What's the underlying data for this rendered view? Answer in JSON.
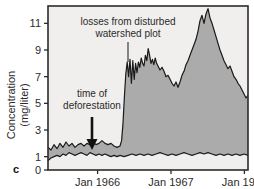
{
  "figure": {
    "panel_label": "c",
    "background": "#ffffff",
    "plot_background": "#f0efed",
    "fill_color": "#ababab",
    "line_color": "#1a1a1a",
    "axis_color": "#2b2b2b"
  },
  "axes": {
    "ylabel_line1": "Concentration",
    "ylabel_line2": "(mg/liter)",
    "yticks": [
      0,
      1,
      3,
      5,
      7,
      9,
      11
    ],
    "ytick_labels": [
      "0",
      "1",
      "3",
      "5",
      "7",
      "9",
      "11"
    ],
    "xtick_labels": [
      "Jan 1966",
      "Jan 1967",
      "Jan 1968"
    ]
  },
  "annotations": [
    {
      "name": "losses-annotation",
      "line1": "losses from disturbed",
      "line2": "watershed plot",
      "has_leader_line": true
    },
    {
      "name": "deforestation-annotation",
      "line1": "time of",
      "line2": "deforestation",
      "has_arrow": true
    }
  ],
  "chart_data": {
    "type": "area",
    "title": "",
    "xlabel": "",
    "ylabel": "Concentration (mg/liter)",
    "ylim": [
      0,
      12.3
    ],
    "xlim": [
      0,
      100
    ],
    "grid": false,
    "legend": null,
    "yticks": [
      0,
      1,
      3,
      5,
      7,
      9,
      11
    ],
    "xtick_positions": [
      24.8,
      61.5,
      98.2
    ],
    "xtick_labels": [
      "Jan 1966",
      "Jan 1967",
      "Jan 1968"
    ],
    "annotations": [
      {
        "text": "losses from disturbed watershed plot",
        "x": 40.0,
        "y": 11.2
      },
      {
        "text": "time of deforestation",
        "x": 18.0,
        "y": 6.3,
        "arrow_to_x": 22.0,
        "arrow_to_y": 1.9
      }
    ],
    "series": [
      {
        "name": "disturbed watershed plot",
        "role": "upper-boundary-filled",
        "x": [
          0,
          1.5,
          3,
          4.5,
          6,
          7.5,
          9,
          10.5,
          12,
          13.5,
          15,
          16.5,
          18,
          19.5,
          21,
          22.5,
          24,
          25.5,
          27,
          28.5,
          30,
          31.5,
          33,
          34.5,
          36,
          36.8,
          37.5,
          38.2,
          38.9,
          39.6,
          40.3,
          41,
          41.7,
          42.4,
          43.1,
          43.8,
          44.5,
          45.2,
          45.9,
          46.6,
          47.3,
          48,
          48.7,
          49.4,
          50.1,
          50.8,
          51.5,
          52.2,
          52.9,
          53.6,
          54.3,
          55,
          56,
          57,
          58,
          59,
          60,
          61,
          62,
          63,
          64,
          65,
          66,
          67,
          68,
          69,
          70,
          71,
          72,
          73,
          74,
          75,
          76,
          77,
          78,
          79,
          80,
          81,
          82,
          83,
          84,
          85,
          86,
          87,
          88,
          89,
          90,
          91,
          92,
          93,
          94,
          95,
          96,
          97,
          98,
          99,
          100
        ],
        "y": [
          1.7,
          1.5,
          1.9,
          1.6,
          2.0,
          1.7,
          2.1,
          1.8,
          2.0,
          1.7,
          1.9,
          2.0,
          1.8,
          2.0,
          1.9,
          2.1,
          1.9,
          2.0,
          2.2,
          2.0,
          1.9,
          2.0,
          1.8,
          1.7,
          1.8,
          2.2,
          3.5,
          5.5,
          7.2,
          8.1,
          7.0,
          8.3,
          6.5,
          8.2,
          6.8,
          8.0,
          7.3,
          8.1,
          7.7,
          8.4,
          8.0,
          7.8,
          8.6,
          8.2,
          9.1,
          8.6,
          8.0,
          8.3,
          7.9,
          8.4,
          8.0,
          7.8,
          7.5,
          7.7,
          7.4,
          7.0,
          7.1,
          6.8,
          6.5,
          6.3,
          6.6,
          6.2,
          6.6,
          7.1,
          7.4,
          7.9,
          8.2,
          8.6,
          9.0,
          9.4,
          9.8,
          10.4,
          11.2,
          11.6,
          11.0,
          11.7,
          12.1,
          11.4,
          11.0,
          10.5,
          10.0,
          9.5,
          9.0,
          8.6,
          8.2,
          7.9,
          7.6,
          7.8,
          7.4,
          7.0,
          6.8,
          6.5,
          6.3,
          6.0,
          5.7,
          5.4,
          5.6
        ]
      },
      {
        "name": "undisturbed reference watershed",
        "role": "lower-boundary",
        "x": [
          0,
          1.5,
          3,
          4.5,
          6,
          7.5,
          9,
          10.5,
          12,
          13.5,
          15,
          16.5,
          18,
          19.5,
          21,
          22.5,
          24,
          25.5,
          27,
          28.5,
          30,
          31.5,
          33,
          34.5,
          36,
          38,
          40,
          42,
          44,
          46,
          48,
          50,
          52,
          54,
          56,
          58,
          60,
          62,
          64,
          66,
          68,
          70,
          72,
          74,
          76,
          78,
          80,
          82,
          84,
          86,
          88,
          90,
          92,
          94,
          96,
          98,
          100
        ],
        "y": [
          0.7,
          0.9,
          1.0,
          1.1,
          1.0,
          1.2,
          1.1,
          1.3,
          1.2,
          1.1,
          1.2,
          1.3,
          1.2,
          1.1,
          1.3,
          1.2,
          1.1,
          1.2,
          1.1,
          1.2,
          1.1,
          1.0,
          1.1,
          1.0,
          1.1,
          1.0,
          1.1,
          1.2,
          1.1,
          1.2,
          1.1,
          1.2,
          1.1,
          1.2,
          1.3,
          1.2,
          1.1,
          1.2,
          1.1,
          1.2,
          1.3,
          1.2,
          1.1,
          1.2,
          1.3,
          1.2,
          1.3,
          1.2,
          1.1,
          1.2,
          1.1,
          1.2,
          1.1,
          1.2,
          1.1,
          1.2,
          1.1
        ]
      }
    ]
  }
}
